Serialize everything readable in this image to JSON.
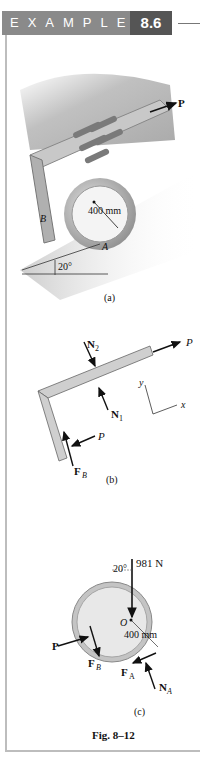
{
  "header": {
    "label": "EXAMPLE",
    "number": "8.6"
  },
  "figure_a": {
    "force_label": "P",
    "radius_label": "400 mm",
    "point_b": "B",
    "point_a": "A",
    "angle_label": "20°",
    "caption": "(a)"
  },
  "figure_b": {
    "n2": "N",
    "n2_sub": "2",
    "n1": "N",
    "n1_sub": "1",
    "p_top": "P",
    "p_bottom": "P",
    "fb": "F",
    "fb_sub": "B",
    "axis_y": "y",
    "axis_x": "x",
    "caption": "(b)"
  },
  "figure_c": {
    "weight_label": "981 N",
    "angle_label": "20°",
    "center": "O",
    "radius_label": "400 mm",
    "p": "P",
    "fb": "F",
    "fb_sub": "B",
    "fa": "F",
    "fa_sub": "A",
    "na": "N",
    "na_sub": "A",
    "caption": "(c)"
  },
  "figure_caption": "Fig. 8–12"
}
